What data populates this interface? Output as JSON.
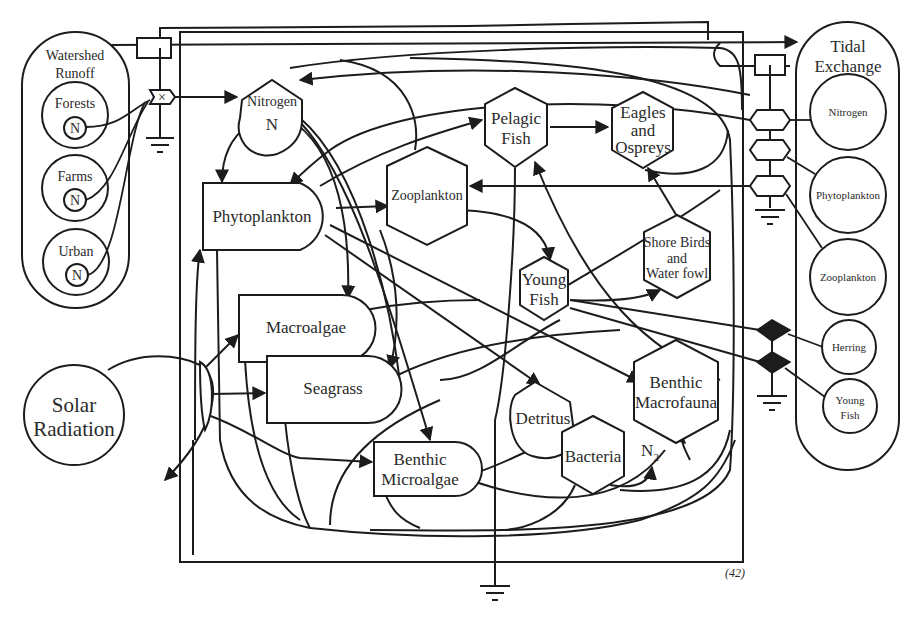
{
  "diagram": {
    "watershed": {
      "label_line1": "Watershed",
      "label_line2": "Runoff",
      "sources": [
        {
          "label": "Forests",
          "symbol": "N"
        },
        {
          "label": "Farms",
          "symbol": "N"
        },
        {
          "label": "Urban",
          "symbol": "N"
        }
      ]
    },
    "tidal": {
      "label_line1": "Tidal",
      "label_line2": "Exchange",
      "sources": [
        {
          "label": "Nitrogen"
        },
        {
          "label": "Phytoplankton"
        },
        {
          "label": "Zooplankton"
        },
        {
          "label": "Herring"
        },
        {
          "label": "Young",
          "label2": "Fish"
        }
      ]
    },
    "solar": {
      "label_line1": "Solar",
      "label_line2": "Radiation"
    },
    "nodes": {
      "nitrogen": {
        "label": "Nitrogen",
        "symbol": "N"
      },
      "phytoplankton": {
        "label": "Phytoplankton"
      },
      "zooplankton": {
        "label": "Zooplankton"
      },
      "pelagic_fish": {
        "line1": "Pelagic",
        "line2": "Fish"
      },
      "eagles": {
        "line1": "Eagles",
        "line2": "and",
        "line3": "Ospreys"
      },
      "shore_birds": {
        "line1": "Shore Birds",
        "line2": "and",
        "line3": "Water fowl"
      },
      "young_fish": {
        "line1": "Young",
        "line2": "Fish"
      },
      "macroalgae": {
        "label": "Macroalgae"
      },
      "seagrass": {
        "label": "Seagrass"
      },
      "benthic_microalgae": {
        "line1": "Benthic",
        "line2": "Microalgae"
      },
      "detritus": {
        "label": "Detritus"
      },
      "bacteria": {
        "label": "Bacteria"
      },
      "benthic_macrofauna": {
        "line1": "Benthic",
        "line2": "Macrofauna"
      },
      "n2": {
        "label": "N",
        "subscript": "2"
      }
    },
    "page_note": "(42)"
  }
}
